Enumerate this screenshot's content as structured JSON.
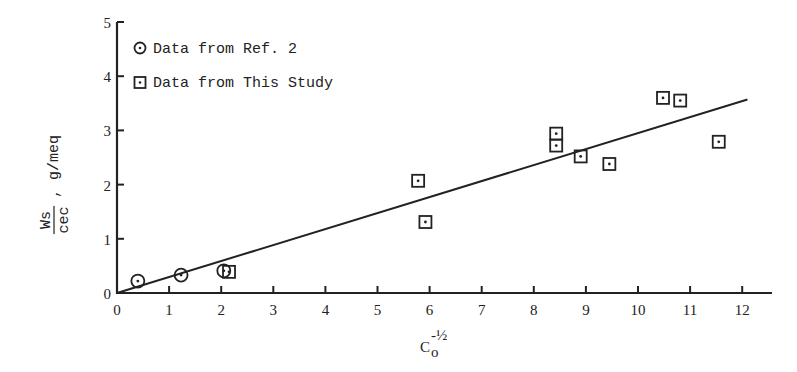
{
  "chart_data": {
    "type": "scatter",
    "title": "",
    "xlabel": "C_o^(-1/2)",
    "ylabel": "Ws/cec , g/meq",
    "xlim": [
      0,
      12.6
    ],
    "ylim": [
      0,
      5
    ],
    "x_ticks": [
      0,
      1,
      2,
      3,
      4,
      5,
      6,
      7,
      8,
      9,
      10,
      11,
      12
    ],
    "y_ticks": [
      0,
      1,
      2,
      3,
      4,
      5
    ],
    "grid": false,
    "legend_position": "upper-left",
    "series": [
      {
        "name": "Data from Ref. 2",
        "marker": "circle-dot",
        "points": [
          [
            0.4,
            0.22
          ],
          [
            1.23,
            0.33
          ],
          [
            2.05,
            0.41
          ]
        ]
      },
      {
        "name": "Data from This Study",
        "marker": "square-dot",
        "points": [
          [
            2.15,
            0.39
          ],
          [
            5.78,
            2.07
          ],
          [
            5.92,
            1.31
          ],
          [
            8.43,
            2.94
          ],
          [
            8.43,
            2.72
          ],
          [
            8.9,
            2.52
          ],
          [
            9.45,
            2.38
          ],
          [
            10.48,
            3.6
          ],
          [
            10.81,
            3.55
          ],
          [
            11.55,
            2.79
          ]
        ]
      }
    ],
    "fit_line": {
      "x0": 0,
      "y0": 0,
      "x1": 12.1,
      "y1": 3.57
    }
  },
  "labels": {
    "legend_ref": "Data from Ref. 2",
    "legend_study": "Data from This Study",
    "y_num": "Ws",
    "y_den": "cec",
    "y_units": ", g/meq",
    "x_base": "C",
    "x_sub": "o",
    "x_sup": "-½"
  }
}
